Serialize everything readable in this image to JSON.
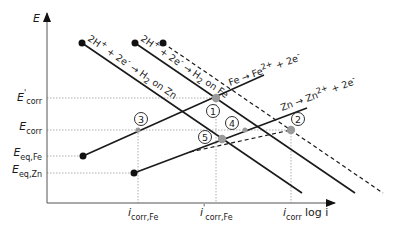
{
  "diagram": {
    "type": "evans-diagram",
    "axes": {
      "y_label": "E",
      "x_label": "log i"
    },
    "y_ticks": [
      {
        "main": "E",
        "sup": "'",
        "sub": "corr",
        "y": 98
      },
      {
        "main": "E",
        "sup": "",
        "sub": "corr",
        "y": 130
      },
      {
        "main": "E",
        "sup": "",
        "sub": "eq,Fe",
        "y": 156
      },
      {
        "main": "E",
        "sup": "",
        "sub": "eq,Zn",
        "y": 173
      }
    ],
    "x_ticks": [
      {
        "main": "i",
        "sup": "",
        "sub": "corr,Fe",
        "x": 138
      },
      {
        "main": "i",
        "sup": "'",
        "sub": "corr,Fe",
        "x": 216
      },
      {
        "main": "i",
        "sup": "",
        "sub": "corr",
        "x": 291
      }
    ],
    "lines": [
      {
        "id": "h2-on-zn",
        "label": "2H⁺ + 2e⁻ → H₂ on Zn",
        "style": "solid"
      },
      {
        "id": "h2-on-fe",
        "label": "2H⁺ + 2e⁻ → H₂ on Fe",
        "style": "solid"
      },
      {
        "id": "h2-on-fe-dashed",
        "label": "",
        "style": "dashed"
      },
      {
        "id": "fe-oxidation",
        "label": "Fe → Fe²⁺ + 2e⁻",
        "style": "solid"
      },
      {
        "id": "zn-oxidation",
        "label": "Zn → Zn²⁺ + 2e⁻",
        "style": "solid"
      },
      {
        "id": "combined-anodic",
        "label": "",
        "style": "dashed"
      }
    ],
    "points": [
      {
        "n": "1"
      },
      {
        "n": "2"
      },
      {
        "n": "3"
      },
      {
        "n": "4"
      },
      {
        "n": "5"
      }
    ],
    "labels": {
      "h2_zn_a": "2H",
      "h2_zn_sup1": "+",
      "h2_zn_b": " + 2e",
      "h2_zn_sup2": "-",
      "h2_zn_c": " → H",
      "h2_zn_sub": "2",
      "h2_zn_d": " on Zn",
      "h2_fe_a": "2H",
      "h2_fe_sup1": "+",
      "h2_fe_b": " + 2e",
      "h2_fe_sup2": "-",
      "h2_fe_c": " → H",
      "h2_fe_sub": "2",
      "h2_fe_d": " on Fe",
      "fe_a": "Fe → Fe",
      "fe_sup1": "2+",
      "fe_b": " + 2e",
      "fe_sup2": "-",
      "zn_a": "Zn → Zn",
      "zn_sup1": "2+",
      "zn_b": " + 2e",
      "zn_sup2": "-"
    },
    "colors": {
      "line": "#1a1a1a",
      "grid": "#9a9a9a",
      "point_fill": "#9a9a9a",
      "endpoint": "#111111"
    }
  }
}
